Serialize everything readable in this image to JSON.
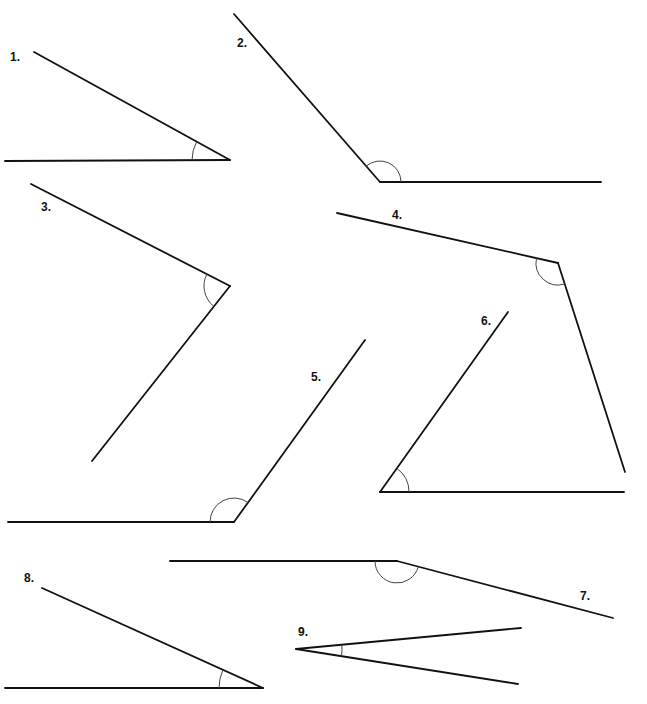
{
  "style": {
    "line_color": "#111111",
    "arc_color": "#444444"
  },
  "angles": [
    {
      "label": "1.",
      "label_pos": [
        10,
        50
      ],
      "vertex": [
        230,
        160
      ],
      "ray1": [
        34,
        52
      ],
      "ray2": [
        5,
        161
      ],
      "arc_r": 38
    },
    {
      "label": "2.",
      "label_pos": [
        237,
        36
      ],
      "vertex": [
        380,
        182
      ],
      "ray1": [
        234,
        14
      ],
      "ray2": [
        601,
        182
      ],
      "arc_r": 21
    },
    {
      "label": "3.",
      "label_pos": [
        41,
        200
      ],
      "vertex": [
        230,
        286
      ],
      "ray1": [
        31,
        184
      ],
      "ray2": [
        92,
        461
      ],
      "arc_r": 26
    },
    {
      "label": "4.",
      "label_pos": [
        392,
        208
      ],
      "vertex": [
        558,
        263
      ],
      "ray1": [
        337,
        213
      ],
      "ray2": [
        625,
        472
      ],
      "arc_r": 22
    },
    {
      "label": "5.",
      "label_pos": [
        311,
        370
      ],
      "vertex": [
        234,
        522
      ],
      "ray1": [
        365,
        340
      ],
      "ray2": [
        8,
        522
      ],
      "arc_r": 24
    },
    {
      "label": "6.",
      "label_pos": [
        481,
        314
      ],
      "vertex": [
        380,
        492
      ],
      "ray1": [
        508,
        312
      ],
      "ray2": [
        624,
        492
      ],
      "arc_r": 29
    },
    {
      "label": "7.",
      "label_pos": [
        580,
        589
      ],
      "vertex": [
        397,
        561
      ],
      "ray1": [
        170,
        561
      ],
      "ray2": [
        613,
        618
      ],
      "arc_r": 22
    },
    {
      "label": "8.",
      "label_pos": [
        24,
        571
      ],
      "vertex": [
        263,
        688
      ],
      "ray1": [
        42,
        588
      ],
      "ray2": [
        5,
        688
      ],
      "arc_r": 44
    },
    {
      "label": "9.",
      "label_pos": [
        298,
        625
      ],
      "vertex": [
        296,
        649
      ],
      "ray1": [
        521,
        628
      ],
      "ray2": [
        518,
        684
      ],
      "arc_r": 46
    }
  ]
}
